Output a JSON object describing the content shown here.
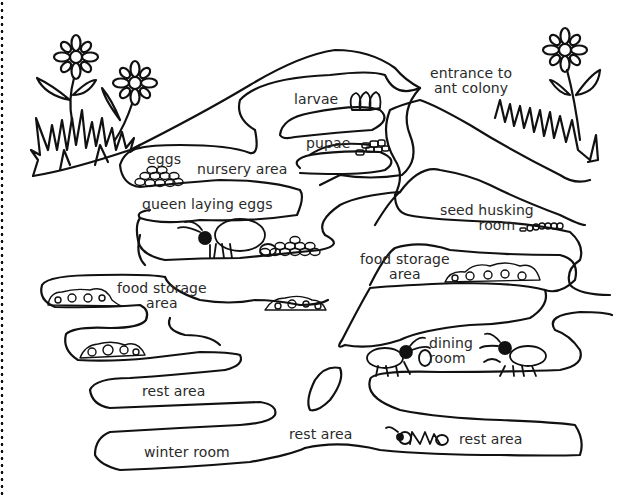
{
  "diagram": {
    "border": "dotted-left-edge",
    "labels": {
      "entrance": [
        "entrance to",
        "ant colony"
      ],
      "larvae": "larvae",
      "pupae": "pupae",
      "eggs": "eggs",
      "nursery": "nursery area",
      "queen": "queen laying eggs",
      "seed_husking": [
        "seed husking",
        "room"
      ],
      "food_storage_right": [
        "food storage",
        "area"
      ],
      "food_storage_left": [
        "food storage",
        "area"
      ],
      "dining": [
        "dining",
        "room"
      ],
      "rest_area_upper": "rest area",
      "winter_room": "winter room",
      "rest_area_middle": "rest area",
      "rest_area_right": "rest area"
    },
    "illustrations": [
      "flowers-left-icon",
      "flowers-right-icon",
      "grass-left-icon",
      "grass-right-icon",
      "larvae-icon",
      "pupae-icon",
      "eggs-pile-icon",
      "queen-ant-icon",
      "eggs-pile-queen-icon",
      "seed-husks-icon",
      "food-pile-right-icon",
      "food-pile-left-upper-icon",
      "food-pile-left-lower-icon",
      "food-pile-center-icon",
      "dining-ant-left-icon",
      "dining-ant-right-icon",
      "resting-ant-icon"
    ],
    "colors": {
      "line": "#111111",
      "background": "#ffffff",
      "text": "#2a2a2a"
    }
  }
}
